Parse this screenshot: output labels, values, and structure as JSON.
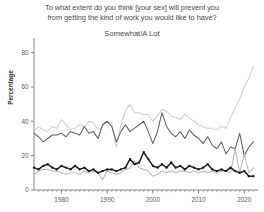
{
  "chart_data": {
    "type": "line",
    "title": "To what extent do you think [your sex] will prevent you from getting the kind of work you would like to have?",
    "title_line1": "To what extent do you think [your sex] will prevent you",
    "title_line2": "from getting the kind of work you would like to have?",
    "subtitle": "Somewhat/A Lot",
    "xlabel": "",
    "ylabel": "Percentage",
    "ylim": [
      0,
      85
    ],
    "xlim": [
      1974,
      2023
    ],
    "grid": false,
    "legend_position": "none",
    "ytick_labels": [
      "0",
      "20",
      "40",
      "60",
      "80"
    ],
    "ytick_values": [
      0,
      20,
      40,
      60,
      80
    ],
    "xtick_labels": [
      "1980",
      "1990",
      "2000",
      "2010",
      "2020"
    ],
    "xtick_values": [
      1980,
      1990,
      2000,
      2010,
      2020
    ],
    "minor_xticks_step": 1,
    "colors": {
      "series_light_high": "#cfcfcf",
      "series_dark_mid": "#5f5f5f",
      "series_black_low": "#1a1a1a",
      "series_light_low": "#b8b8b8",
      "axis": "#7a7a7a",
      "text": "#4a4a4a"
    },
    "x": [
      1974,
      1975,
      1976,
      1977,
      1978,
      1979,
      1980,
      1981,
      1982,
      1983,
      1984,
      1985,
      1986,
      1987,
      1988,
      1989,
      1990,
      1991,
      1992,
      1993,
      1994,
      1995,
      1996,
      1997,
      1998,
      1999,
      2000,
      2001,
      2002,
      2003,
      2004,
      2005,
      2006,
      2007,
      2008,
      2009,
      2010,
      2011,
      2012,
      2013,
      2014,
      2015,
      2016,
      2017,
      2018,
      2019,
      2020,
      2021,
      2022
    ],
    "series": [
      {
        "name": "light-gray-upper",
        "color": "#cfcfcf",
        "values": [
          34,
          37,
          35,
          34,
          37,
          36,
          41,
          38,
          35,
          36,
          38,
          37,
          40,
          39,
          35,
          37,
          40,
          39,
          25,
          38,
          46,
          50,
          45,
          45,
          44,
          44,
          40,
          43,
          47,
          46,
          43,
          42,
          41,
          44,
          42,
          40,
          38,
          37,
          36,
          36,
          35,
          37,
          36,
          42,
          48,
          53,
          60,
          65,
          72
        ]
      },
      {
        "name": "dark-gray-middle",
        "color": "#5f5f5f",
        "values": [
          33,
          31,
          28,
          30,
          32,
          32,
          33,
          31,
          34,
          33,
          32,
          37,
          33,
          34,
          30,
          38,
          40,
          37,
          28,
          34,
          38,
          34,
          36,
          38,
          40,
          34,
          27,
          34,
          45,
          37,
          33,
          31,
          34,
          30,
          35,
          32,
          30,
          27,
          31,
          26,
          24,
          28,
          21,
          25,
          24,
          33,
          20,
          25,
          28
        ]
      },
      {
        "name": "light-gray-lower",
        "color": "#b8b8b8",
        "values": [
          9,
          11,
          12,
          12,
          11,
          11,
          10,
          9,
          10,
          10,
          9,
          11,
          10,
          11,
          10,
          6,
          11,
          10,
          9,
          10,
          12,
          13,
          17,
          13,
          12,
          11,
          8,
          9,
          11,
          10,
          11,
          10,
          11,
          11,
          10,
          11,
          10,
          11,
          10,
          11,
          10,
          11,
          11,
          10,
          24,
          10,
          21,
          10,
          13
        ]
      },
      {
        "name": "black-lower",
        "color": "#1a1a1a",
        "values": [
          13,
          12,
          14,
          15,
          13,
          12,
          14,
          13,
          12,
          14,
          12,
          13,
          11,
          12,
          10,
          11,
          12,
          12,
          11,
          12,
          13,
          18,
          15,
          16,
          22,
          18,
          14,
          13,
          15,
          13,
          16,
          13,
          14,
          12,
          14,
          13,
          12,
          13,
          15,
          12,
          11,
          12,
          11,
          13,
          11,
          10,
          11,
          8,
          8
        ]
      }
    ]
  }
}
